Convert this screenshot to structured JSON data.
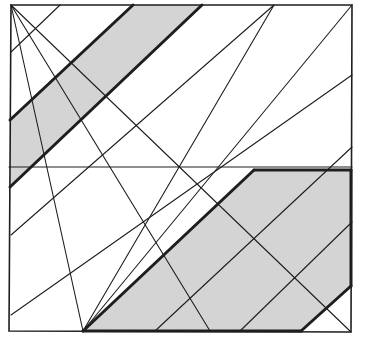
{
  "diagram": {
    "title": "",
    "colors": {
      "background": "#ffffff",
      "stroke": "#1e1e1e",
      "shade": "#d4d4d4"
    },
    "square": [
      [
        11,
        5
      ],
      [
        352,
        5
      ],
      [
        351,
        332
      ],
      [
        9,
        331
      ]
    ],
    "shaded_regions": [
      {
        "name": "upper-band",
        "points": [
          [
            133,
            5
          ],
          [
            202,
            5
          ],
          [
            10,
            187
          ],
          [
            10,
            120
          ]
        ]
      },
      {
        "name": "lower-polygon",
        "points": [
          [
            254,
            170
          ],
          [
            351,
            170
          ],
          [
            351,
            286
          ],
          [
            301,
            331
          ],
          [
            83,
            331
          ]
        ]
      }
    ],
    "thin_lines": [
      [
        [
          9,
          167
        ],
        [
          352,
          167
        ]
      ],
      [
        [
          11,
          5
        ],
        [
          83,
          331
        ]
      ],
      [
        [
          11,
          5
        ],
        [
          351,
          332
        ]
      ],
      [
        [
          11,
          5
        ],
        [
          210,
          331
        ]
      ],
      [
        [
          60,
          5
        ],
        [
          11,
          52
        ]
      ],
      [
        [
          274,
          5
        ],
        [
          83,
          331
        ]
      ],
      [
        [
          274,
          5
        ],
        [
          11,
          235
        ]
      ],
      [
        [
          352,
          5
        ],
        [
          83,
          331
        ]
      ],
      [
        [
          352,
          75
        ],
        [
          11,
          315
        ]
      ],
      [
        [
          352,
          147
        ],
        [
          155,
          331
        ]
      ],
      [
        [
          352,
          222
        ],
        [
          240,
          331
        ]
      ]
    ],
    "thick_lines": [
      [
        [
          133,
          5
        ],
        [
          10,
          120
        ]
      ],
      [
        [
          202,
          5
        ],
        [
          10,
          187
        ]
      ],
      [
        [
          254,
          170
        ],
        [
          83,
          331
        ]
      ],
      [
        [
          254,
          170
        ],
        [
          351,
          170
        ]
      ],
      [
        [
          351,
          170
        ],
        [
          351,
          286
        ]
      ],
      [
        [
          351,
          286
        ],
        [
          301,
          331
        ]
      ],
      [
        [
          301,
          331
        ],
        [
          83,
          331
        ]
      ]
    ]
  }
}
